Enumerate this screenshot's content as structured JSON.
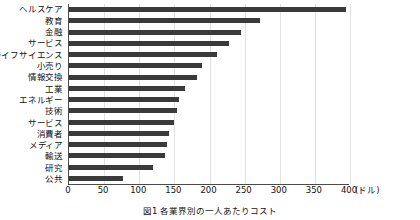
{
  "chart_data": {
    "type": "bar",
    "orientation": "horizontal",
    "title": "",
    "xlabel": "(ドル)",
    "ylabel": "",
    "xlim": [
      0,
      400
    ],
    "grid": true,
    "legend": false,
    "unit_label": "(ドル)",
    "xticks": [
      "0",
      "50",
      "100",
      "150",
      "200",
      "250",
      "300",
      "350",
      "400"
    ],
    "xtick_values": [
      0,
      50,
      100,
      150,
      200,
      250,
      300,
      350,
      400
    ],
    "categories": [
      "ヘルスケア",
      "教育",
      "金融",
      "サービス",
      "ライフサイエンス",
      "小売り",
      "情報交換",
      "工業",
      "エネルギー",
      "技術",
      "サービス",
      "消費者",
      "メディア",
      "輸送",
      "研究",
      "公共"
    ],
    "values": [
      395,
      272,
      245,
      228,
      210,
      190,
      182,
      165,
      157,
      154,
      150,
      143,
      140,
      137,
      119,
      77
    ],
    "bar_color": "#3a3a3a",
    "axis_color": "#4a4a4a",
    "grid_color": "#e2e2e2"
  },
  "caption": {
    "text": "図1 各業界別の一人あたりコスト"
  }
}
